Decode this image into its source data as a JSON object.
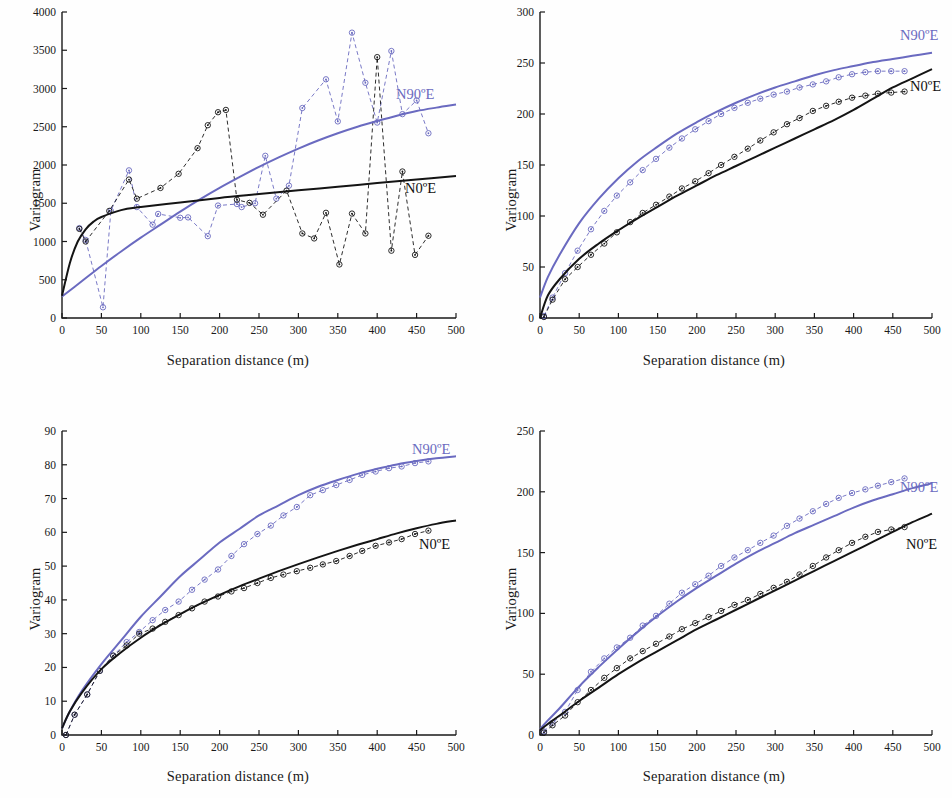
{
  "figure": {
    "axis_label_x": "Separation distance (m)",
    "axis_label_y": "Variogram",
    "series_labels": {
      "blue": "N90ºE",
      "black": "N0ºE"
    },
    "colors": {
      "blue": "#6a6ac0",
      "black": "#141414",
      "axis": "#1a1a1a",
      "background": "#fefefe"
    }
  },
  "chart_data": [
    {
      "id": "panel-1",
      "type": "line",
      "title": "",
      "xlabel": "Separation distance (m)",
      "ylabel": "Variogram",
      "xlim": [
        0,
        500
      ],
      "ylim": [
        0,
        4000
      ],
      "xticks": [
        0,
        50,
        100,
        150,
        200,
        250,
        300,
        350,
        400,
        450,
        500
      ],
      "yticks": [
        0,
        500,
        1000,
        1500,
        2000,
        2500,
        3000,
        3500,
        4000
      ],
      "grid": false,
      "legend_position": "inline-right",
      "series": [
        {
          "name": "N90ºE",
          "role": "model",
          "style": "solid",
          "color": "#6a6ac0",
          "x": [
            0,
            25,
            50,
            75,
            100,
            125,
            150,
            175,
            200,
            225,
            250,
            275,
            300,
            325,
            350,
            375,
            400,
            425,
            450,
            475,
            500
          ],
          "values": [
            280,
            480,
            680,
            870,
            1050,
            1220,
            1390,
            1550,
            1700,
            1840,
            1975,
            2100,
            2215,
            2320,
            2415,
            2500,
            2575,
            2645,
            2705,
            2750,
            2790
          ]
        },
        {
          "name": "N0ºE",
          "role": "model",
          "style": "solid",
          "color": "#141414",
          "x": [
            0,
            10,
            20,
            30,
            40,
            50,
            75,
            100,
            150,
            200,
            250,
            300,
            350,
            400,
            450,
            500
          ],
          "values": [
            290,
            720,
            1000,
            1160,
            1260,
            1320,
            1410,
            1450,
            1510,
            1570,
            1620,
            1670,
            1715,
            1765,
            1810,
            1855
          ]
        },
        {
          "name": "N90ºE experimental",
          "role": "experimental",
          "style": "dashed-markers",
          "color": "#6a6ac0",
          "x": [
            22,
            30,
            52,
            62,
            85,
            95,
            115,
            122,
            150,
            160,
            185,
            198,
            222,
            228,
            245,
            258,
            272,
            288,
            305,
            335,
            350,
            368,
            385,
            400,
            418,
            432,
            450,
            465
          ],
          "values": [
            1175,
            1020,
            140,
            1400,
            1930,
            1450,
            1220,
            1360,
            1310,
            1315,
            1070,
            1470,
            1490,
            1450,
            1500,
            2120,
            1560,
            1730,
            2745,
            3120,
            2570,
            3730,
            3075,
            2555,
            3490,
            2665,
            2845,
            2415
          ]
        },
        {
          "name": "N0ºE experimental",
          "role": "experimental",
          "style": "dashed-markers",
          "color": "#141414",
          "x": [
            22,
            30,
            60,
            85,
            95,
            125,
            148,
            172,
            185,
            198,
            208,
            222,
            238,
            255,
            285,
            305,
            320,
            335,
            352,
            368,
            385,
            400,
            418,
            432,
            448,
            465
          ],
          "values": [
            1165,
            1000,
            1400,
            1810,
            1560,
            1700,
            1885,
            2220,
            2520,
            2690,
            2720,
            1545,
            1505,
            1350,
            1665,
            1105,
            1040,
            1375,
            700,
            1365,
            1105,
            3410,
            880,
            1915,
            825,
            1075
          ]
        }
      ]
    },
    {
      "id": "panel-2",
      "type": "line",
      "title": "",
      "xlabel": "Separation distance (m)",
      "ylabel": "Variogram",
      "xlim": [
        0,
        500
      ],
      "ylim": [
        0,
        300
      ],
      "xticks": [
        0,
        50,
        100,
        150,
        200,
        250,
        300,
        350,
        400,
        450,
        500
      ],
      "yticks": [
        0,
        50,
        100,
        150,
        200,
        250,
        300
      ],
      "grid": false,
      "legend_position": "inline-right",
      "series": [
        {
          "name": "N90ºE",
          "role": "model",
          "style": "solid",
          "color": "#6a6ac0",
          "x": [
            0,
            10,
            25,
            50,
            75,
            100,
            125,
            150,
            175,
            200,
            225,
            250,
            275,
            300,
            325,
            350,
            375,
            400,
            425,
            450,
            475,
            500
          ],
          "values": [
            20,
            40,
            62,
            93,
            117,
            137,
            154,
            168,
            181,
            192,
            202,
            211,
            219,
            226,
            232,
            238,
            243,
            247,
            251,
            254,
            257,
            260
          ]
        },
        {
          "name": "N0ºE",
          "role": "model",
          "style": "solid",
          "color": "#141414",
          "x": [
            0,
            10,
            25,
            50,
            75,
            100,
            125,
            150,
            175,
            200,
            225,
            250,
            275,
            300,
            325,
            350,
            375,
            400,
            425,
            450,
            475,
            500
          ],
          "values": [
            0,
            22,
            38,
            58,
            73,
            86,
            98,
            109,
            120,
            130,
            140,
            149,
            158,
            167,
            176,
            185,
            194,
            204,
            215,
            226,
            235,
            244
          ]
        },
        {
          "name": "N90ºE experimental",
          "role": "experimental",
          "style": "dashed-markers",
          "color": "#6a6ac0",
          "x": [
            5,
            16,
            32,
            48,
            65,
            82,
            98,
            115,
            131,
            148,
            165,
            181,
            198,
            215,
            231,
            248,
            265,
            281,
            298,
            315,
            331,
            348,
            365,
            381,
            398,
            415,
            431,
            448,
            465
          ],
          "values": [
            2,
            20,
            44,
            66,
            87,
            105,
            120,
            133,
            145,
            156,
            167,
            176,
            185,
            193,
            200,
            206,
            211,
            215,
            219,
            222,
            226,
            229,
            232,
            236,
            239,
            241,
            242,
            242,
            242
          ]
        },
        {
          "name": "N0ºE experimental",
          "role": "experimental",
          "style": "dashed-markers",
          "color": "#141414",
          "x": [
            5,
            16,
            32,
            48,
            65,
            82,
            98,
            115,
            131,
            148,
            165,
            181,
            198,
            215,
            231,
            248,
            265,
            281,
            298,
            315,
            331,
            348,
            365,
            381,
            398,
            415,
            431,
            448,
            465
          ],
          "values": [
            1,
            18,
            38,
            50,
            62,
            73,
            84,
            94,
            103,
            111,
            119,
            127,
            134,
            142,
            150,
            158,
            166,
            174,
            182,
            190,
            196,
            203,
            208,
            212,
            216,
            218,
            220,
            221,
            222
          ]
        }
      ]
    },
    {
      "id": "panel-3",
      "type": "line",
      "title": "",
      "xlabel": "Separation distance (m)",
      "ylabel": "Variogram",
      "xlim": [
        0,
        500
      ],
      "ylim": [
        0,
        90
      ],
      "xticks": [
        0,
        50,
        100,
        150,
        200,
        250,
        300,
        350,
        400,
        450,
        500
      ],
      "yticks": [
        0,
        10,
        20,
        30,
        40,
        50,
        60,
        70,
        80,
        90
      ],
      "grid": false,
      "legend_position": "inline-right",
      "series": [
        {
          "name": "N90ºE",
          "role": "model",
          "style": "solid",
          "color": "#6a6ac0",
          "x": [
            0,
            10,
            25,
            50,
            75,
            100,
            125,
            150,
            175,
            200,
            225,
            250,
            275,
            300,
            325,
            350,
            375,
            400,
            425,
            450,
            475,
            500
          ],
          "values": [
            2,
            7,
            13,
            21,
            28,
            35,
            41,
            47,
            52,
            57,
            61,
            65,
            68,
            71,
            73.5,
            75.5,
            77.3,
            78.8,
            80.1,
            81.1,
            81.9,
            82.5
          ]
        },
        {
          "name": "N0ºE",
          "role": "model",
          "style": "solid",
          "color": "#141414",
          "x": [
            0,
            10,
            25,
            50,
            75,
            100,
            125,
            150,
            175,
            200,
            225,
            250,
            275,
            300,
            325,
            350,
            375,
            400,
            425,
            450,
            475,
            500
          ],
          "values": [
            2,
            7,
            12.5,
            19.5,
            24.5,
            28.8,
            32.5,
            35.8,
            38.8,
            41.5,
            44,
            46.3,
            48.5,
            50.6,
            52.6,
            54.5,
            56.3,
            58,
            59.7,
            61.2,
            62.5,
            63.5
          ]
        },
        {
          "name": "N90ºE experimental",
          "role": "experimental",
          "style": "dashed-markers",
          "color": "#6a6ac0",
          "x": [
            5,
            16,
            32,
            48,
            65,
            82,
            98,
            115,
            131,
            148,
            165,
            181,
            198,
            215,
            231,
            248,
            265,
            281,
            298,
            315,
            331,
            348,
            365,
            381,
            398,
            415,
            431,
            448,
            465
          ],
          "values": [
            0,
            6,
            12,
            19,
            23.5,
            27.5,
            30.5,
            34,
            37,
            39.5,
            43,
            46,
            49,
            53,
            56.5,
            59.5,
            62,
            65,
            67.5,
            71,
            72.5,
            74,
            75.5,
            77,
            78,
            79,
            79.5,
            80.5,
            81
          ]
        },
        {
          "name": "N0ºE experimental",
          "role": "experimental",
          "style": "dashed-markers",
          "color": "#141414",
          "x": [
            5,
            16,
            32,
            48,
            65,
            82,
            98,
            115,
            131,
            148,
            165,
            181,
            198,
            215,
            231,
            248,
            265,
            281,
            298,
            315,
            331,
            348,
            365,
            381,
            398,
            415,
            431,
            448,
            465
          ],
          "values": [
            0,
            6,
            12,
            19,
            23.5,
            26.5,
            30,
            31.5,
            33.5,
            35.5,
            37.5,
            39.5,
            41,
            42.5,
            43.5,
            45,
            46.5,
            47.5,
            48.5,
            49.5,
            50.5,
            51.5,
            53,
            54.5,
            56,
            57,
            58,
            59.5,
            60.5
          ]
        }
      ]
    },
    {
      "id": "panel-4",
      "type": "line",
      "title": "",
      "xlabel": "Separation distance (m)",
      "ylabel": "Variogram",
      "xlim": [
        0,
        500
      ],
      "ylim": [
        0,
        250
      ],
      "xticks": [
        0,
        50,
        100,
        150,
        200,
        250,
        300,
        350,
        400,
        450,
        500
      ],
      "yticks": [
        0,
        50,
        100,
        150,
        200,
        250
      ],
      "grid": false,
      "legend_position": "inline-right",
      "series": [
        {
          "name": "N90ºE",
          "role": "model",
          "style": "solid",
          "color": "#6a6ac0",
          "x": [
            0,
            10,
            25,
            50,
            75,
            100,
            125,
            150,
            175,
            200,
            225,
            250,
            275,
            300,
            325,
            350,
            375,
            400,
            425,
            450,
            475,
            500
          ],
          "values": [
            5,
            12,
            22,
            40,
            56,
            71,
            85,
            98,
            110,
            121,
            131,
            141,
            150,
            158,
            166,
            173,
            180,
            187,
            193,
            198,
            203,
            207
          ]
        },
        {
          "name": "N0ºE",
          "role": "model",
          "style": "solid",
          "color": "#141414",
          "x": [
            0,
            10,
            25,
            50,
            75,
            100,
            125,
            150,
            175,
            200,
            225,
            250,
            275,
            300,
            325,
            350,
            375,
            400,
            425,
            450,
            475,
            500
          ],
          "values": [
            4,
            9,
            16,
            28,
            39,
            50,
            60,
            69,
            78,
            87,
            95,
            103,
            111,
            119,
            127,
            135,
            143,
            151,
            159,
            167,
            175,
            182
          ]
        },
        {
          "name": "N90ºE experimental",
          "role": "experimental",
          "style": "dashed-markers",
          "color": "#6a6ac0",
          "x": [
            5,
            16,
            32,
            48,
            65,
            82,
            98,
            115,
            131,
            148,
            165,
            181,
            198,
            215,
            231,
            248,
            265,
            281,
            298,
            315,
            331,
            348,
            365,
            381,
            398,
            415,
            431,
            448,
            465
          ],
          "values": [
            3,
            10,
            19,
            37,
            52,
            63,
            72,
            80,
            90,
            98,
            108,
            117,
            124,
            131,
            139,
            146,
            152,
            158,
            164,
            172,
            178,
            184,
            190,
            195,
            199,
            202,
            205,
            208,
            211
          ]
        },
        {
          "name": "N0ºE experimental",
          "role": "experimental",
          "style": "dashed-markers",
          "color": "#141414",
          "x": [
            5,
            16,
            32,
            48,
            65,
            82,
            98,
            115,
            131,
            148,
            165,
            181,
            198,
            215,
            231,
            248,
            265,
            281,
            298,
            315,
            331,
            348,
            365,
            381,
            398,
            415,
            431,
            448,
            465
          ],
          "values": [
            2,
            8,
            16,
            27,
            37,
            47,
            55,
            63,
            69,
            75,
            81,
            87,
            92,
            97,
            102,
            107,
            111,
            116,
            121,
            126,
            132,
            139,
            146,
            152,
            158,
            163,
            167,
            169,
            171
          ]
        }
      ]
    }
  ]
}
